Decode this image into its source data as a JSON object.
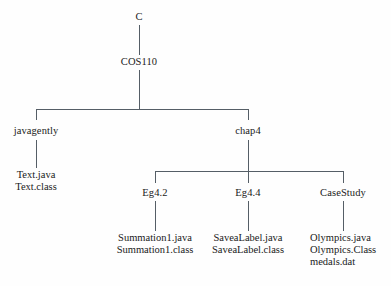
{
  "diagram": {
    "type": "directory-tree",
    "title": "",
    "line_color": "#555e66",
    "background": "#fefefe",
    "nodes": {
      "root": "C",
      "course": "COS110",
      "javagently": "javagently",
      "chap4": "chap4",
      "eg42": "Eg4.2",
      "eg44": "Eg4.4",
      "casestudy": "CaseStudy"
    },
    "files": {
      "javagently": [
        "Text.java",
        "Text.class"
      ],
      "eg42": [
        "Summation1.java",
        "Summation1.class"
      ],
      "eg44": [
        "SaveaLabel.java",
        "SaveaLabel.class"
      ],
      "casestudy": [
        "Olympics.java",
        "Olympics.Class",
        "medals.dat"
      ]
    }
  }
}
